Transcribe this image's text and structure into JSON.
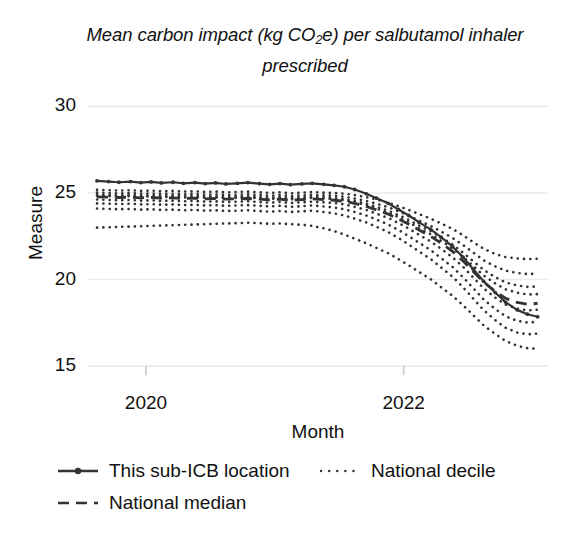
{
  "chart_data": {
    "type": "line",
    "title": "Mean carbon impact (kg CO2e) per salbutamol inhaler prescribed",
    "title_parts": {
      "before": "Mean carbon impact (kg CO",
      "sub": "2",
      "after": "e) per salbutamol inhaler prescribed"
    },
    "xlabel": "Month",
    "ylabel": "Measure",
    "ylim": [
      14.2,
      30.6
    ],
    "yticks": [
      15,
      20,
      25,
      30
    ],
    "ytick_labels": [
      "15",
      "20",
      "25",
      "30"
    ],
    "xlim": [
      2019.55,
      2023.12
    ],
    "xticks": [
      2020,
      2022
    ],
    "xtick_labels": [
      "2020",
      "2022"
    ],
    "grid": "horizontal-only",
    "legend_position": "below-axes",
    "legend": [
      {
        "label": "This sub-ICB location",
        "style": "solid-with-marker",
        "color": "#333333"
      },
      {
        "label": "National decile",
        "style": "dotted",
        "color": "#333333"
      },
      {
        "label": "National median",
        "style": "dashed",
        "color": "#333333"
      }
    ],
    "x": [
      2019.62,
      2019.71,
      2019.79,
      2019.88,
      2019.96,
      2020.04,
      2020.12,
      2020.21,
      2020.29,
      2020.38,
      2020.46,
      2020.54,
      2020.62,
      2020.71,
      2020.79,
      2020.88,
      2020.96,
      2021.04,
      2021.12,
      2021.21,
      2021.29,
      2021.38,
      2021.46,
      2021.54,
      2021.62,
      2021.71,
      2021.79,
      2021.88,
      2021.96,
      2022.04,
      2022.12,
      2022.21,
      2022.29,
      2022.38,
      2022.46,
      2022.54,
      2022.62,
      2022.71,
      2022.79,
      2022.88,
      2022.96,
      2023.04
    ],
    "series": [
      {
        "name": "This sub-ICB location",
        "style": "solid-with-marker",
        "values": [
          25.7,
          25.66,
          25.62,
          25.66,
          25.6,
          25.64,
          25.58,
          25.62,
          25.56,
          25.6,
          25.54,
          25.58,
          25.52,
          25.56,
          25.6,
          25.54,
          25.5,
          25.54,
          25.48,
          25.52,
          25.56,
          25.5,
          25.44,
          25.36,
          25.2,
          24.95,
          24.7,
          24.4,
          24.05,
          23.7,
          23.3,
          22.9,
          22.45,
          21.9,
          21.3,
          20.6,
          19.9,
          19.25,
          18.7,
          18.25,
          18.0,
          17.85
        ]
      },
      {
        "name": "National median",
        "style": "dashed",
        "values": [
          24.78,
          24.76,
          24.74,
          24.76,
          24.72,
          24.74,
          24.7,
          24.72,
          24.68,
          24.7,
          24.66,
          24.68,
          24.64,
          24.66,
          24.68,
          24.64,
          24.6,
          24.64,
          24.58,
          24.62,
          24.66,
          24.62,
          24.58,
          24.52,
          24.4,
          24.22,
          24.02,
          23.78,
          23.5,
          23.2,
          22.86,
          22.5,
          22.1,
          21.62,
          21.08,
          20.46,
          19.86,
          19.32,
          18.92,
          18.68,
          18.58,
          18.62
        ]
      },
      {
        "name": "National decile 90",
        "style": "dotted",
        "values": [
          25.18,
          25.16,
          25.14,
          25.16,
          25.12,
          25.14,
          25.1,
          25.12,
          25.08,
          25.1,
          25.06,
          25.08,
          25.04,
          25.06,
          25.08,
          25.04,
          25.0,
          25.04,
          24.98,
          25.02,
          25.06,
          25.02,
          25.0,
          24.96,
          24.88,
          24.76,
          24.62,
          24.44,
          24.24,
          24.02,
          23.78,
          23.52,
          23.24,
          22.92,
          22.56,
          22.16,
          21.78,
          21.48,
          21.3,
          21.22,
          21.18,
          21.2
        ]
      },
      {
        "name": "National decile 80",
        "style": "dotted",
        "values": [
          25.02,
          25.0,
          24.98,
          25.0,
          24.96,
          24.98,
          24.94,
          24.96,
          24.92,
          24.94,
          24.9,
          24.92,
          24.88,
          24.9,
          24.92,
          24.88,
          24.84,
          24.88,
          24.82,
          24.86,
          24.9,
          24.86,
          24.84,
          24.78,
          24.68,
          24.54,
          24.38,
          24.18,
          23.94,
          23.68,
          23.4,
          23.1,
          22.78,
          22.4,
          22.0,
          21.56,
          21.12,
          20.76,
          20.52,
          20.38,
          20.32,
          20.34
        ]
      },
      {
        "name": "National decile 70",
        "style": "dotted",
        "values": [
          24.9,
          24.88,
          24.86,
          24.88,
          24.84,
          24.86,
          24.82,
          24.84,
          24.8,
          24.82,
          24.78,
          24.8,
          24.76,
          24.78,
          24.8,
          24.76,
          24.72,
          24.76,
          24.7,
          24.74,
          24.78,
          24.74,
          24.7,
          24.64,
          24.54,
          24.38,
          24.2,
          23.98,
          23.72,
          23.44,
          23.12,
          22.8,
          22.44,
          22.02,
          21.56,
          21.06,
          20.56,
          20.14,
          19.84,
          19.66,
          19.58,
          19.6
        ]
      },
      {
        "name": "National decile 60",
        "style": "dotted",
        "values": [
          24.84,
          24.82,
          24.8,
          24.82,
          24.78,
          24.8,
          24.76,
          24.78,
          24.74,
          24.76,
          24.72,
          24.74,
          24.7,
          24.72,
          24.74,
          24.7,
          24.66,
          24.7,
          24.64,
          24.68,
          24.72,
          24.68,
          24.64,
          24.58,
          24.46,
          24.3,
          24.1,
          23.86,
          23.6,
          23.3,
          22.96,
          22.62,
          22.24,
          21.8,
          21.32,
          20.78,
          20.24,
          19.78,
          19.44,
          19.24,
          19.14,
          19.16
        ]
      },
      {
        "name": "National decile 40",
        "style": "dotted",
        "values": [
          24.62,
          24.6,
          24.58,
          24.6,
          24.56,
          24.58,
          24.54,
          24.56,
          24.52,
          24.54,
          24.5,
          24.52,
          24.48,
          24.5,
          24.52,
          24.48,
          24.44,
          24.48,
          24.42,
          24.46,
          24.5,
          24.46,
          24.42,
          24.34,
          24.2,
          24.02,
          23.8,
          23.56,
          23.26,
          22.94,
          22.58,
          22.2,
          21.78,
          21.28,
          20.74,
          20.12,
          19.5,
          18.96,
          18.56,
          18.32,
          18.22,
          18.26
        ]
      },
      {
        "name": "National decile 30",
        "style": "dotted",
        "values": [
          24.4,
          24.38,
          24.36,
          24.38,
          24.34,
          24.36,
          24.32,
          24.34,
          24.3,
          24.32,
          24.28,
          24.3,
          24.26,
          24.28,
          24.3,
          24.26,
          24.22,
          24.26,
          24.2,
          24.24,
          24.28,
          24.22,
          24.16,
          24.06,
          23.9,
          23.7,
          23.46,
          23.18,
          22.86,
          22.5,
          22.12,
          21.7,
          21.24,
          20.72,
          20.14,
          19.5,
          18.86,
          18.3,
          17.88,
          17.62,
          17.52,
          17.56
        ]
      },
      {
        "name": "National decile 20",
        "style": "dotted",
        "values": [
          24.1,
          24.08,
          24.06,
          24.08,
          24.04,
          24.06,
          24.02,
          24.04,
          24.0,
          24.02,
          23.98,
          24.0,
          23.96,
          23.98,
          24.0,
          23.96,
          23.92,
          23.96,
          23.9,
          23.94,
          23.98,
          23.9,
          23.82,
          23.7,
          23.52,
          23.3,
          23.04,
          22.74,
          22.4,
          22.02,
          21.62,
          21.18,
          20.7,
          20.16,
          19.56,
          18.9,
          18.24,
          17.66,
          17.22,
          16.94,
          16.84,
          16.88
        ]
      },
      {
        "name": "National decile 10",
        "style": "dotted",
        "values": [
          23.0,
          23.02,
          23.04,
          23.06,
          23.08,
          23.1,
          23.12,
          23.14,
          23.16,
          23.18,
          23.2,
          23.22,
          23.24,
          23.26,
          23.28,
          23.26,
          23.22,
          23.24,
          23.2,
          23.16,
          23.1,
          22.96,
          22.8,
          22.6,
          22.36,
          22.1,
          21.82,
          21.52,
          21.18,
          20.82,
          20.44,
          20.02,
          19.56,
          19.06,
          18.52,
          17.94,
          17.36,
          16.86,
          16.46,
          16.18,
          16.04,
          16.0
        ]
      }
    ]
  },
  "axes": {
    "x_title": "Month",
    "y_title": "Measure"
  }
}
